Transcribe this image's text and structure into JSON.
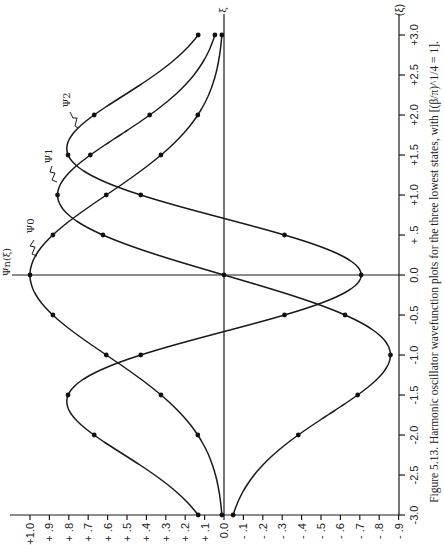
{
  "chart_data": {
    "type": "line",
    "orientation": "rotated-90-ccw",
    "title": "",
    "caption": "Figure 5.13.  Harmonic oscillator wavefunction plots for the three lowest states, with [(β/π)^1/4 = 1].",
    "xlabel": "(ξ)",
    "ylabel": "Ψn(ξ)",
    "top_axis_mark": "ξ",
    "xlim": [
      -3.0,
      3.0
    ],
    "ylim": [
      -0.9,
      1.0
    ],
    "x_ticks": [
      "-3.0",
      "-2.5",
      "-2.0",
      "-1.5",
      "-1.0",
      "-0.5",
      "0.0",
      "+ .5",
      "+1.0",
      "+1.5",
      "+2.0",
      "+2.5",
      "+3.0"
    ],
    "y_ticks": [
      "+1.0",
      "+ .9",
      "+ .8",
      "+ .7",
      "+ .6",
      "+ .5",
      "+ .4",
      "+ .3",
      "+ .2",
      "+ .1",
      "0.0",
      "- .1",
      "- .2",
      "- .3",
      "- .4",
      "- .5",
      "- .6",
      "- .7",
      "- .8",
      "- .9"
    ],
    "grid": false,
    "x": [
      -3.0,
      -2.0,
      -1.5,
      -1.0,
      -0.5,
      0.0,
      0.5,
      1.0,
      1.5,
      2.0,
      3.0
    ],
    "series": [
      {
        "name": "Ψ₀",
        "values": [
          0.011,
          0.135,
          0.325,
          0.607,
          0.882,
          1.0,
          0.882,
          0.607,
          0.325,
          0.135,
          0.011
        ]
      },
      {
        "name": "Ψ₁",
        "values": [
          -0.047,
          -0.383,
          -0.689,
          -0.858,
          -0.624,
          0.0,
          0.624,
          0.858,
          0.689,
          0.383,
          0.047
        ]
      },
      {
        "name": "Ψ₂",
        "values": [
          0.133,
          0.669,
          0.804,
          0.429,
          -0.312,
          -0.707,
          -0.312,
          0.429,
          0.804,
          0.669,
          0.133
        ]
      }
    ]
  },
  "labels": {
    "psi_n": "Ψn(ξ)",
    "psi0": "Ψ0",
    "psi1": "Ψ1",
    "psi2": "Ψ2",
    "xi_axis": "(ξ)",
    "xi_top": "ξ"
  },
  "caption": "Figure 5.13.  Harmonic oscillator wavefunction plots for the three lowest states, with [(β/π)^1/4 = 1]."
}
